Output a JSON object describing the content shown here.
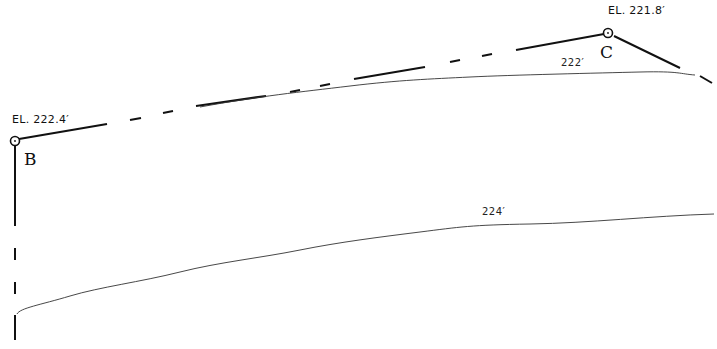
{
  "diagram": {
    "colors": {
      "line": "#111111",
      "contour": "#333333",
      "background": "#ffffff"
    },
    "points": [
      {
        "id": "B",
        "label": "B",
        "elevation_label": "EL. 222.4′"
      },
      {
        "id": "C",
        "label": "C",
        "elevation_label": "EL. 221.8′"
      }
    ],
    "contours": [
      {
        "label": "222′"
      },
      {
        "label": "224′"
      }
    ],
    "line_styles": {
      "property_line": "solid-dashed alternating (long dash / short dash)",
      "contour_line": "thin solid"
    }
  }
}
